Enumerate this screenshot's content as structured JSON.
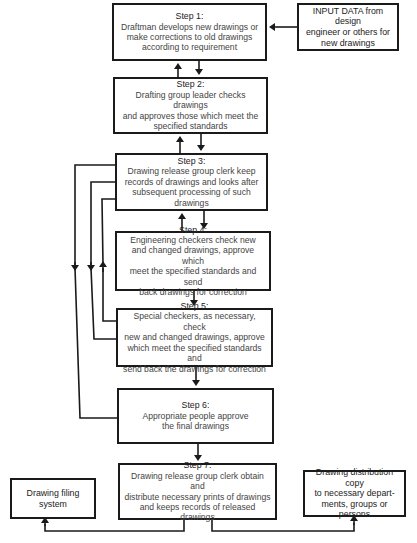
{
  "diagram": {
    "steps": [
      {
        "title": "Step 1:",
        "lines": [
          "Draftman develops new drawings or",
          "make corrections to old drawings",
          "according to requirement"
        ]
      },
      {
        "title": "Step 2:",
        "lines": [
          "Drafting group leader checks drawings",
          "and approves those which meet the",
          "specified standards"
        ]
      },
      {
        "title": "Step 3:",
        "lines": [
          "Drawing release group clerk keep",
          "records of drawings and looks after",
          "subsequent processing of such drawings"
        ]
      },
      {
        "title": "Step 4:",
        "lines": [
          "Engineering checkers check new",
          "and changed drawings, approve which",
          "meet the specified standards and send",
          "back drawings for correction"
        ]
      },
      {
        "title": "Step 5:",
        "lines": [
          "Special checkers, as necessary, check",
          "new and changed drawings, approve",
          "which meet the specified standards and",
          "send back the drawings for correction"
        ]
      },
      {
        "title": "Step 6:",
        "lines": [
          "Appropriate people approve",
          "the final drawings"
        ]
      },
      {
        "title": "Step 7:",
        "lines": [
          "Drawing release group clerk obtain and",
          "distribute necessary prints of drawings",
          "and keeps records of released drawings"
        ]
      }
    ],
    "input_box": {
      "lines": [
        "INPUT DATA from design",
        "engineer or others for",
        "new drawings"
      ]
    },
    "filing_box": {
      "lines": [
        "Drawing filing",
        "system"
      ]
    },
    "distribution_box": {
      "lines": [
        "Drawing distribution copy",
        "to necessary depart-",
        "ments, groups or persons"
      ]
    }
  }
}
